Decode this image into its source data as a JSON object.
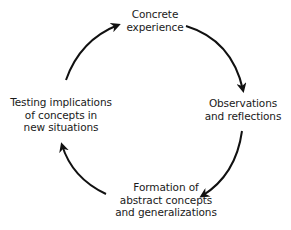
{
  "diagram": {
    "type": "cycle",
    "direction": "clockwise",
    "stroke_color": "#111111",
    "nodes": [
      {
        "id": "concrete-experience",
        "position": "top",
        "lines": [
          "Concrete",
          "experience"
        ]
      },
      {
        "id": "observations-reflections",
        "position": "right",
        "lines": [
          "Observations",
          "and reflections"
        ]
      },
      {
        "id": "abstract-concepts",
        "position": "bottom",
        "lines": [
          "Formation of",
          "abstract concepts",
          "and generalizations"
        ]
      },
      {
        "id": "testing-implications",
        "position": "left",
        "lines": [
          "Testing implications",
          "of concepts in",
          "new situations"
        ]
      }
    ],
    "edges": [
      {
        "from": "testing-implications",
        "to": "concrete-experience"
      },
      {
        "from": "concrete-experience",
        "to": "observations-reflections"
      },
      {
        "from": "observations-reflections",
        "to": "abstract-concepts"
      },
      {
        "from": "abstract-concepts",
        "to": "testing-implications"
      }
    ]
  }
}
